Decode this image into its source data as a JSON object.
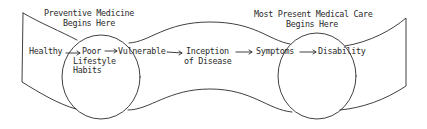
{
  "diagram": {
    "headings": {
      "preventive_line1": "Preventive Medicine",
      "preventive_line2": "Begins Here",
      "medical_line1": "Most Present Medical Care",
      "medical_line2": "Begins Here"
    },
    "stages": [
      {
        "line1": "Healthy"
      },
      {
        "line1": "Poor",
        "line2": "Lifestyle",
        "line3": "Habits"
      },
      {
        "line1": "Vulnerable"
      },
      {
        "line1": "Inception",
        "line2": "of Disease"
      },
      {
        "line1": "Symptoms"
      },
      {
        "line1": "Disability"
      }
    ],
    "colors": {
      "stroke": "#2a2a2a",
      "background": "#ffffff"
    }
  }
}
